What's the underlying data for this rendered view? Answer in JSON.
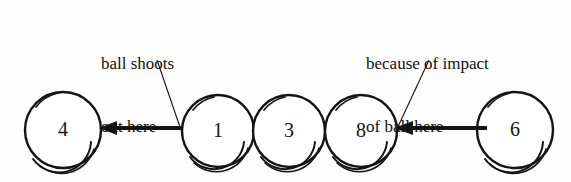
{
  "figure": {
    "background_color": "#fefefe",
    "stroke_color": "#141414",
    "text_color": "#111111"
  },
  "annotations": [
    {
      "id": "ball-shoots-out-here",
      "line1": "ball shoots",
      "line2": "out here",
      "leader_from": {
        "x": 157,
        "y": 60
      },
      "leader_to": {
        "x": 181,
        "y": 130
      }
    },
    {
      "id": "because-of-impact-of-ball-here",
      "line1": "because of impact",
      "line2": "of ball here",
      "leader_from": {
        "x": 429,
        "y": 60
      },
      "leader_to": {
        "x": 396,
        "y": 131
      }
    }
  ],
  "balls": [
    {
      "label": "4",
      "cx": 63,
      "cy": 130,
      "r": 38
    },
    {
      "label": "1",
      "cx": 218,
      "cy": 131,
      "r": 36
    },
    {
      "label": "3",
      "cx": 289,
      "cy": 131,
      "r": 36
    },
    {
      "label": "8",
      "cx": 361,
      "cy": 131,
      "r": 36
    },
    {
      "label": "6",
      "cx": 515,
      "cy": 130,
      "r": 38
    }
  ],
  "arrows": [
    {
      "id": "left-arrow",
      "from_x": 183,
      "to_x": 101,
      "y": 128,
      "direction": "left",
      "meaning": "ball 1 shoots out toward ball 4"
    },
    {
      "id": "right-arrow",
      "from_x": 487,
      "to_x": 396,
      "y": 128,
      "direction": "left",
      "meaning": "ball 6 impacts ball 8"
    }
  ]
}
